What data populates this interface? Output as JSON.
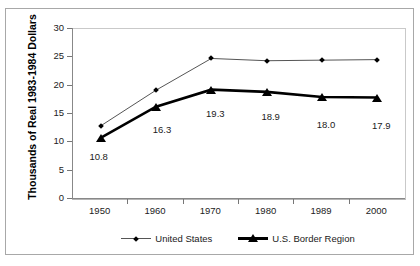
{
  "chart_data": {
    "type": "line",
    "title": "",
    "subtitle": "",
    "xlabel": "",
    "ylabel": "Thousands of Real 1983-1984 Dollars",
    "categories": [
      "1950",
      "1960",
      "1970",
      "1980",
      "1989",
      "2000"
    ],
    "ylim": [
      0,
      30
    ],
    "yticks": [
      0,
      5,
      10,
      15,
      20,
      25,
      30
    ],
    "ytick_labels": [
      "0",
      "5",
      "10",
      "15",
      "20",
      "25",
      "30"
    ],
    "grid": false,
    "legend_position": "bottom",
    "series": [
      {
        "name": "United States",
        "marker": "diamond",
        "line_style": "thin",
        "color": "#000000",
        "values": [
          12.9,
          19.2,
          24.8,
          24.4,
          24.5,
          24.6
        ],
        "data_labels": [
          "",
          "",
          "",
          "",
          "",
          ""
        ]
      },
      {
        "name": "U.S. Border Region",
        "marker": "triangle",
        "line_style": "thick",
        "color": "#000000",
        "values": [
          10.8,
          16.3,
          19.3,
          18.9,
          18.0,
          17.9
        ],
        "data_labels": [
          "10.8",
          "16.3",
          "19.3",
          "18.9",
          "18.0",
          "17.9"
        ]
      }
    ]
  },
  "legend": {
    "items": [
      {
        "label": "United States"
      },
      {
        "label": "U.S. Border Region"
      }
    ]
  },
  "colors": {
    "frame": "#a8a8a8",
    "axis": "#888888",
    "series_us": "#555555",
    "series_border": "#000000",
    "text": "#1a1a1a"
  }
}
